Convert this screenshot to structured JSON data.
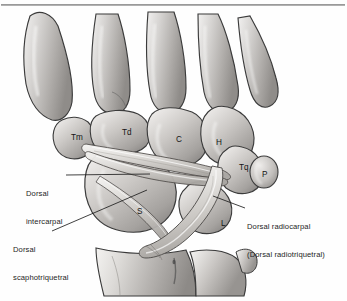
{
  "figure": {
    "type": "anatomical-illustration",
    "style": "grayscale pencil/airbrush medical illustration",
    "background_color": "#fefefe",
    "rule_color": "#8d8d8d"
  },
  "bone_labels": [
    {
      "id": "trapezium",
      "text": "Tm",
      "x": 71,
      "y": 133
    },
    {
      "id": "trapezoid",
      "text": "Td",
      "x": 122,
      "y": 128
    },
    {
      "id": "capitate",
      "text": "C",
      "x": 176,
      "y": 135
    },
    {
      "id": "hamate",
      "text": "H",
      "x": 216,
      "y": 138
    },
    {
      "id": "triquetrum",
      "text": "Tq",
      "x": 239,
      "y": 163
    },
    {
      "id": "pisiform",
      "text": "P",
      "x": 262,
      "y": 170
    },
    {
      "id": "scaphoid",
      "text": "S",
      "x": 137,
      "y": 207
    },
    {
      "id": "lunate",
      "text": "L",
      "x": 221,
      "y": 219
    }
  ],
  "callouts": [
    {
      "id": "dorsal-intercarpal",
      "lines": [
        "Dorsal",
        "intercarpal"
      ],
      "text_x": 26,
      "text_y": 171,
      "leader": {
        "x1": 66,
        "y1": 175,
        "x2": 150,
        "y2": 174
      }
    },
    {
      "id": "dorsal-scaphotriquetral",
      "lines": [
        "Dorsal",
        "scaphotriquetral"
      ],
      "text_x": 13,
      "text_y": 227,
      "leader": {
        "x1": 52,
        "y1": 231,
        "x2": 147,
        "y2": 190
      }
    },
    {
      "id": "dorsal-radiocarpal",
      "lines": [
        "Dorsal radiocarpal",
        "(Dorsal radiotriquetral)"
      ],
      "text_x": 247,
      "text_y": 204,
      "leader": {
        "x1": 245,
        "y1": 208,
        "x2": 213,
        "y2": 196
      }
    }
  ],
  "structures": {
    "metacarpals": [
      "second",
      "third",
      "fourth",
      "fifth"
    ],
    "thumb_metacarpal": "first metacarpal",
    "forearm_bones": [
      "radius",
      "ulna"
    ],
    "ligaments": [
      "dorsal intercarpal",
      "dorsal scaphotriquetral",
      "dorsal radiocarpal"
    ]
  }
}
